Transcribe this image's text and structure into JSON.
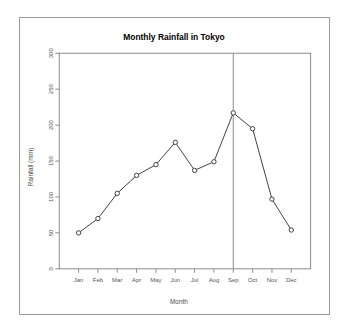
{
  "figure": {
    "title": "Monthly Rainfall in Tokyo",
    "background_color": "#ffffff",
    "frame_color": "#9a9a9a"
  },
  "chart_data": {
    "type": "line",
    "title": "Monthly Rainfall in Tokyo",
    "xlabel": "Month",
    "ylabel": "Rainfall (mm)",
    "categories": [
      "Jan",
      "Feb",
      "Mar",
      "Apr",
      "May",
      "Jun",
      "Jul",
      "Aug",
      "Sep",
      "Oct",
      "Nov",
      "Dec"
    ],
    "values": [
      50,
      70,
      105,
      130,
      145,
      176,
      137,
      149,
      217,
      195,
      97,
      54
    ],
    "series": [
      {
        "name": "Rainfall (mm)",
        "values": [
          50,
          70,
          105,
          130,
          145,
          176,
          137,
          149,
          217,
          195,
          97,
          54
        ]
      }
    ],
    "ylim": [
      0,
      300
    ],
    "yticks": [
      0,
      50,
      100,
      150,
      200,
      250,
      300
    ],
    "ytick_labels": [
      "0",
      "50",
      "100",
      "150",
      "200",
      "250",
      "300"
    ],
    "xtick_labels": [
      "Jan",
      "Feb",
      "Mar",
      "Apr",
      "May",
      "Jun",
      "Jul",
      "Aug",
      "Sep",
      "Oct",
      "Nov",
      "Dec"
    ],
    "grid": false,
    "legend": false,
    "legend_position": "none",
    "marker": "open-circle",
    "line_color": "#3f3f4d",
    "marker_fill": "#ffffff",
    "annotations": [
      {
        "type": "vertical-line",
        "at_category": "Sep",
        "label": "",
        "color": "#8a8a92"
      }
    ],
    "axis_tick_rotation_y": 90
  }
}
